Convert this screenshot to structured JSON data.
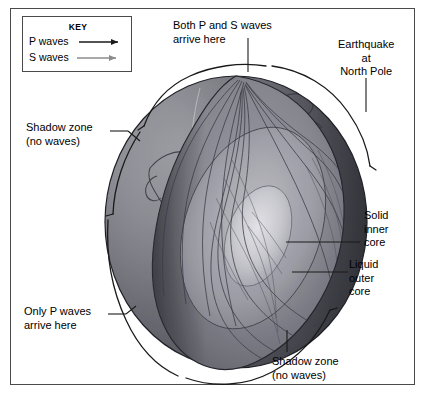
{
  "figure": {
    "frame_color": "#4a4a4a",
    "background": "#ffffff"
  },
  "key": {
    "title": "KEY",
    "entries": [
      {
        "label": "P waves",
        "icon": "arrow-right-icon",
        "color": "#1a1a1a"
      },
      {
        "label": "S waves",
        "icon": "arrow-right-icon",
        "color": "#8c8c8c"
      }
    ]
  },
  "labels": {
    "both_ps": "Both P and S waves\narrive here",
    "earthquake": "Earthquake\nat\nNorth Pole",
    "shadow_zone_top": "Shadow zone\n(no waves)",
    "only_p": "Only P waves\narrive here",
    "solid_inner_core": "Solid\ninner\ncore",
    "liquid_outer_core": "Liquid\nouter\ncore",
    "shadow_zone_bottom": "Shadow zone\n(no waves)"
  },
  "globe": {
    "surface_label": "Earth surface with continents",
    "cutaway_label": "Cutaway wedge revealing interior",
    "layers": [
      {
        "name": "mantle",
        "shade": "#808089"
      },
      {
        "name": "liquid outer core",
        "shade": "#9a9aa2"
      },
      {
        "name": "solid inner core",
        "shade": "#c8c8cd"
      }
    ],
    "source_point": "North Pole earthquake focus"
  }
}
